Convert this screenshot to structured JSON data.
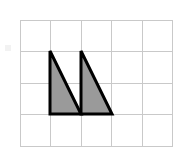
{
  "figure": {
    "title": "",
    "background_color": "#ffffff",
    "canvas": {
      "width": 178,
      "height": 156
    }
  },
  "grid": {
    "name": "square-grid",
    "columns": 5,
    "rows": 4,
    "origin_x": 20,
    "origin_y": 20,
    "cell_width": 30.5,
    "cell_height": 31.5,
    "line_color": "#c9c9c9",
    "line_width": 1,
    "visible": true
  },
  "shapes": [
    {
      "name": "left-triangle",
      "type": "right-triangle",
      "points": "50,51 50,114 81,114",
      "vertices": [
        {
          "label": "apex",
          "x": 50,
          "y": 51
        },
        {
          "label": "bottom-left",
          "x": 50,
          "y": 114
        },
        {
          "label": "bottom-right",
          "x": 81,
          "y": 114
        }
      ],
      "fill_color": "#9a9a9a",
      "stroke_color": "#000000",
      "stroke_width": 3,
      "base_cells": 1,
      "height_cells": 2
    },
    {
      "name": "right-triangle",
      "type": "right-triangle",
      "points": "81,51 81,114 112,114",
      "vertices": [
        {
          "label": "apex",
          "x": 81,
          "y": 51
        },
        {
          "label": "bottom-left",
          "x": 81,
          "y": 114
        },
        {
          "label": "bottom-right",
          "x": 112,
          "y": 114
        }
      ],
      "fill_color": "#9a9a9a",
      "stroke_color": "#000000",
      "stroke_width": 3,
      "base_cells": 1,
      "height_cells": 2
    }
  ],
  "marks": [
    {
      "name": "edge-artifact",
      "x": 5,
      "y": 45,
      "width": 6,
      "height": 6,
      "color": "#f2f2f2"
    }
  ]
}
